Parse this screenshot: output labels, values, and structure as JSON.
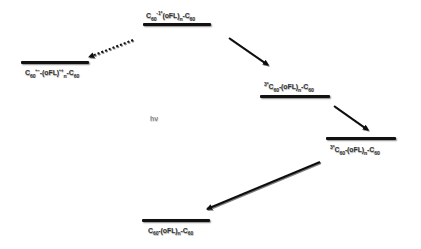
{
  "diagram": {
    "type": "energy-level-diagram",
    "states": [
      {
        "id": "excited_singlet",
        "label": "C60-1*(oFL)n-C60",
        "prefix": "",
        "core": "C",
        "core_sub": "60",
        "core_sup": "-1*",
        "middle": "(oFL)",
        "middle_sub": "n",
        "middle_sup": "",
        "suffix": "-C",
        "suffix_sub": "60"
      },
      {
        "id": "charge_separated",
        "label": "C60•−-(oFL)•+n-C60",
        "prefix": "",
        "core": "C",
        "core_sub": "60",
        "core_sup": "•−",
        "middle": "-(oFL)",
        "middle_sub": "n",
        "middle_sup": "•+",
        "suffix": "-C",
        "suffix_sub": "60"
      },
      {
        "id": "triplet_upper",
        "label": "3*C60-(oFL)n-C60",
        "prefix": "3*",
        "core": "C",
        "core_sub": "60",
        "core_sup": "",
        "middle": "-(oFL)",
        "middle_sub": "n",
        "middle_sup": "",
        "suffix": "-C",
        "suffix_sub": "60"
      },
      {
        "id": "triplet_lower",
        "label": "3*C60-(oFL)n-C60",
        "prefix": "3*",
        "core": "C",
        "core_sub": "60",
        "core_sup": "",
        "middle": "-(oFL)",
        "middle_sub": "n",
        "middle_sup": "",
        "suffix": "-C",
        "suffix_sub": "60"
      },
      {
        "id": "ground",
        "label": "C60-(oFL)n-C60",
        "prefix": "",
        "core": "C",
        "core_sub": "60",
        "core_sup": "",
        "middle": "-(oFL)",
        "middle_sub": "n",
        "middle_sup": "",
        "suffix": "-C",
        "suffix_sub": "60"
      }
    ],
    "excitation_label": "hν",
    "arrows": [
      {
        "from": "ground",
        "to": "excited_singlet",
        "style": "solid",
        "meaning": "photoexcitation"
      },
      {
        "from": "excited_singlet",
        "to": "charge_separated",
        "style": "dotted"
      },
      {
        "from": "excited_singlet",
        "to": "triplet_upper",
        "style": "solid"
      },
      {
        "from": "triplet_upper",
        "to": "triplet_lower",
        "style": "solid"
      },
      {
        "from": "triplet_lower",
        "to": "ground",
        "style": "solid"
      }
    ],
    "colors": {
      "line": "#111111",
      "text": "#333333",
      "hv_text": "#8a8a8a",
      "background": "#ffffff"
    }
  }
}
